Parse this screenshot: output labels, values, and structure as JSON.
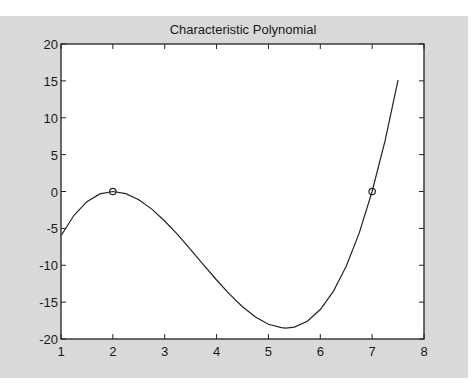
{
  "chart_data": {
    "type": "line",
    "title": "Characteristic Polynomial",
    "xlabel": "",
    "ylabel": "",
    "xlim": [
      1,
      8
    ],
    "ylim": [
      -20,
      20
    ],
    "xticks": [
      1,
      2,
      3,
      4,
      5,
      6,
      7,
      8
    ],
    "yticks": [
      -20,
      -15,
      -10,
      -5,
      0,
      5,
      10,
      15,
      20
    ],
    "grid": false,
    "legend": null,
    "series": [
      {
        "name": "p(x) = (x-2)^2 (x-7)",
        "style": "solid line",
        "x": [
          1,
          1.25,
          1.5,
          1.75,
          2,
          2.25,
          2.5,
          2.75,
          3,
          3.25,
          3.5,
          3.75,
          4,
          4.25,
          4.5,
          4.75,
          5,
          5.25,
          5.333,
          5.5,
          5.75,
          6,
          6.25,
          6.5,
          6.75,
          7,
          7.25,
          7.5
        ],
        "y": [
          -6,
          -3.23,
          -1.38,
          -0.33,
          0,
          -0.3,
          -1.13,
          -2.39,
          -4,
          -5.86,
          -7.88,
          -9.95,
          -12,
          -13.92,
          -15.63,
          -17.02,
          -18,
          -18.46,
          -18.52,
          -18.38,
          -17.58,
          -16,
          -13.55,
          -10.13,
          -5.64,
          0,
          6.89,
          15.13
        ]
      },
      {
        "name": "roots",
        "style": "circle markers",
        "x": [
          2,
          7
        ],
        "y": [
          0,
          0
        ]
      }
    ],
    "annotations": []
  },
  "colors": {
    "figure_bg": "#d9d9d9",
    "axes_bg": "#ffffff",
    "line": "#222222"
  }
}
